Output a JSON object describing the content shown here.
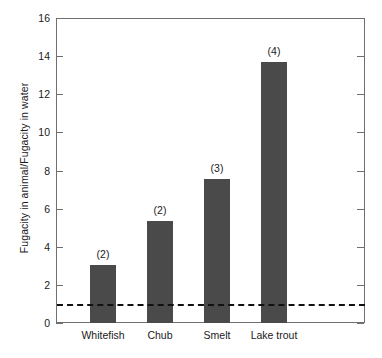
{
  "chart_data": {
    "type": "bar",
    "title": "",
    "xlabel": "",
    "ylabel": "Fugacity in animal/Fugacity in water",
    "categories": [
      "Whitefish",
      "Chub",
      "Smelt",
      "Lake trout"
    ],
    "values": [
      3.05,
      5.35,
      7.55,
      13.7
    ],
    "point_labels": [
      "(2)",
      "(2)",
      "(3)",
      "(4)"
    ],
    "ylim": [
      0,
      16
    ],
    "yticks": [
      0,
      2,
      4,
      6,
      8,
      10,
      12,
      14,
      16
    ],
    "ytick_labels": [
      "0",
      "2",
      "4",
      "6",
      "8",
      "10",
      "12",
      "14",
      "16"
    ],
    "grid": false,
    "legend": false,
    "reference_line": {
      "value": 1,
      "style": "dashed",
      "color": "#111111"
    },
    "bar_color": "#4a4a4a",
    "axis_color": "#6f6f6f"
  }
}
